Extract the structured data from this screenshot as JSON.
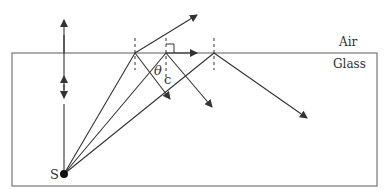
{
  "labels": {
    "air": "Air",
    "glass": "Glass",
    "source": "S",
    "theta": "θ",
    "theta_sub": "c"
  },
  "colors": {
    "line": "#333333",
    "box": "#666666",
    "background": "#ffffff"
  },
  "geometry": {
    "box": {
      "x": 12,
      "y": 53,
      "width": 365,
      "height": 133
    },
    "source": {
      "x": 64,
      "y": 174
    },
    "interface_y": 53,
    "normals_x": [
      135,
      166,
      214
    ],
    "rays": [
      {
        "name": "vertical-ray",
        "from": [
          64,
          174
        ],
        "to": [
          64,
          53
        ],
        "transmitted_to": [
          64,
          22
        ]
      },
      {
        "name": "refracted-ray",
        "hit": [
          135,
          53
        ],
        "transmitted_to": [
          197,
          15
        ],
        "reflected_to": [
          170,
          99
        ]
      },
      {
        "name": "critical-ray",
        "hit": [
          166,
          53
        ],
        "grazing_to": [
          197,
          53
        ],
        "reflected_to": [
          212,
          107
        ]
      },
      {
        "name": "total-internal-reflection-ray",
        "hit": [
          214,
          53
        ],
        "reflected_to": [
          307,
          118
        ]
      }
    ]
  }
}
